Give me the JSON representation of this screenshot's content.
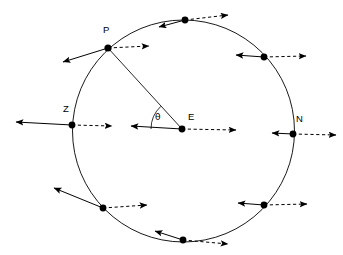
{
  "figure": {
    "title": "",
    "type": "vector-diagram",
    "canvas": {
      "width": 343,
      "height": 255
    },
    "colors": {
      "stroke": "#000000",
      "background": "#ffffff",
      "dash": "#000000"
    }
  },
  "circle": {
    "center": {
      "x": 183.5,
      "y": 131
    },
    "radius": 111,
    "stroke_width": 0.9
  },
  "labels": {
    "P": "P",
    "Z": "Z",
    "E": "E",
    "N": "N",
    "theta": "θ"
  },
  "label_positions": {
    "P": {
      "x": 103,
      "y": 33
    },
    "Z": {
      "x": 63,
      "y": 112
    },
    "E": {
      "x": 188,
      "y": 120
    },
    "N": {
      "x": 296,
      "y": 122
    },
    "theta": {
      "x": 155,
      "y": 120
    }
  },
  "points": [
    {
      "name": "point-P",
      "x": 108,
      "y": 48,
      "label": "P",
      "r": 3.6
    },
    {
      "name": "point-E-center",
      "x": 182,
      "y": 129,
      "label": "E",
      "r": 3.4
    },
    {
      "name": "point-Z",
      "x": 72,
      "y": 125,
      "label": "Z",
      "r": 3.4
    },
    {
      "name": "point-N",
      "x": 293,
      "y": 134,
      "label": "N",
      "r": 3.4
    },
    {
      "name": "point-top",
      "x": 185,
      "y": 20,
      "label": "",
      "r": 3.4
    },
    {
      "name": "point-upper-right",
      "x": 264,
      "y": 57,
      "label": "",
      "r": 3.4
    },
    {
      "name": "point-lower-left",
      "x": 103,
      "y": 208,
      "label": "",
      "r": 3.4
    },
    {
      "name": "point-bottom",
      "x": 183,
      "y": 240,
      "label": "",
      "r": 3.4
    },
    {
      "name": "point-lower-right",
      "x": 264,
      "y": 205,
      "label": "",
      "r": 3.4
    }
  ],
  "solid_arrows": [
    {
      "name": "arrow-solid-P",
      "x1": 108,
      "y1": 48,
      "x2": 63,
      "y2": 62
    },
    {
      "name": "arrow-solid-E",
      "x1": 182,
      "y1": 129,
      "x2": 131,
      "y2": 126
    },
    {
      "name": "arrow-solid-Z",
      "x1": 72,
      "y1": 125,
      "x2": 16,
      "y2": 122
    },
    {
      "name": "arrow-solid-N",
      "x1": 293,
      "y1": 134,
      "x2": 272,
      "y2": 133
    },
    {
      "name": "arrow-solid-top",
      "x1": 185,
      "y1": 20,
      "x2": 159,
      "y2": 27
    },
    {
      "name": "arrow-solid-upper-right",
      "x1": 264,
      "y1": 57,
      "x2": 236,
      "y2": 55
    },
    {
      "name": "arrow-solid-lower-left",
      "x1": 103,
      "y1": 208,
      "x2": 54,
      "y2": 188
    },
    {
      "name": "arrow-solid-bottom",
      "x1": 183,
      "y1": 240,
      "x2": 155,
      "y2": 231
    },
    {
      "name": "arrow-solid-lower-right",
      "x1": 264,
      "y1": 205,
      "x2": 238,
      "y2": 203
    }
  ],
  "dashed_arrows": [
    {
      "name": "arrow-dashed-P",
      "x1": 108,
      "y1": 48,
      "x2": 149,
      "y2": 46
    },
    {
      "name": "arrow-dashed-E",
      "x1": 182,
      "y1": 129,
      "x2": 236,
      "y2": 130
    },
    {
      "name": "arrow-dashed-Z",
      "x1": 72,
      "y1": 125,
      "x2": 112,
      "y2": 126
    },
    {
      "name": "arrow-dashed-N",
      "x1": 293,
      "y1": 134,
      "x2": 336,
      "y2": 135
    },
    {
      "name": "arrow-dashed-top",
      "x1": 185,
      "y1": 20,
      "x2": 228,
      "y2": 15
    },
    {
      "name": "arrow-dashed-upper-right",
      "x1": 264,
      "y1": 57,
      "x2": 306,
      "y2": 56
    },
    {
      "name": "arrow-dashed-lower-left",
      "x1": 103,
      "y1": 208,
      "x2": 147,
      "y2": 205
    },
    {
      "name": "arrow-dashed-bottom",
      "x1": 183,
      "y1": 240,
      "x2": 228,
      "y2": 244
    },
    {
      "name": "arrow-dashed-lower-right",
      "x1": 264,
      "y1": 205,
      "x2": 307,
      "y2": 204
    }
  ],
  "radius_lines": [
    {
      "name": "radius-line-P-E",
      "x1": 108,
      "y1": 48,
      "x2": 182,
      "y2": 129
    }
  ],
  "angle_arc": {
    "name": "angle-arc-theta",
    "vertex": {
      "x": 182,
      "y": 129
    },
    "radius": 31,
    "from_deg": 180,
    "to_deg": 227,
    "label": "θ"
  }
}
